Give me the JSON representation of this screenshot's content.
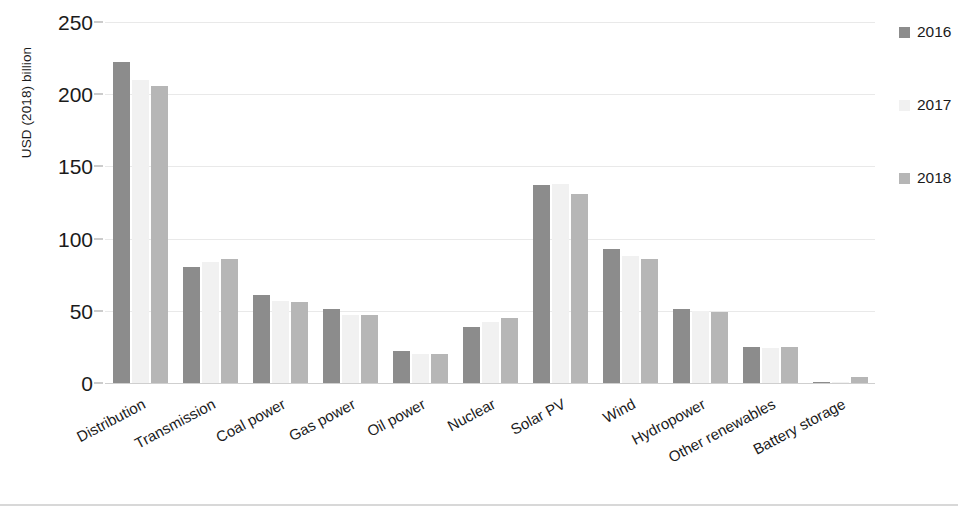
{
  "chart_data": {
    "type": "bar",
    "title": "",
    "xlabel": "",
    "ylabel": "USD (2018) billion",
    "ylim": [
      0,
      250
    ],
    "yticks": [
      0,
      50,
      100,
      150,
      200,
      250
    ],
    "grid": true,
    "legend_position": "right",
    "categories": [
      "Distribution",
      "Transmission",
      "Coal power",
      "Gas power",
      "Oil power",
      "Nuclear",
      "Solar PV",
      "Wind",
      "Hydropower",
      "Other renewables",
      "Battery storage"
    ],
    "series": [
      {
        "name": "2016",
        "color": "#8c8c8c",
        "values": [
          222,
          80,
          61,
          51,
          22,
          39,
          137,
          93,
          51,
          25,
          1
        ]
      },
      {
        "name": "2017",
        "color": "#f1f1f1",
        "values": [
          210,
          84,
          57,
          47,
          20,
          42,
          138,
          88,
          50,
          24,
          0.5
        ]
      },
      {
        "name": "2018",
        "color": "#b6b6b6",
        "values": [
          206,
          86,
          56,
          47,
          20,
          45,
          131,
          86,
          49,
          25,
          4
        ]
      }
    ]
  },
  "axis": {
    "y_title": "USD (2018) billion",
    "y_tick_labels": [
      "0",
      "50",
      "100",
      "150",
      "200",
      "250"
    ]
  },
  "legend": {
    "items": [
      {
        "label": "2016",
        "color": "#8c8c8c"
      },
      {
        "label": "2017",
        "color": "#f1f1f1"
      },
      {
        "label": "2018",
        "color": "#b6b6b6"
      }
    ]
  }
}
